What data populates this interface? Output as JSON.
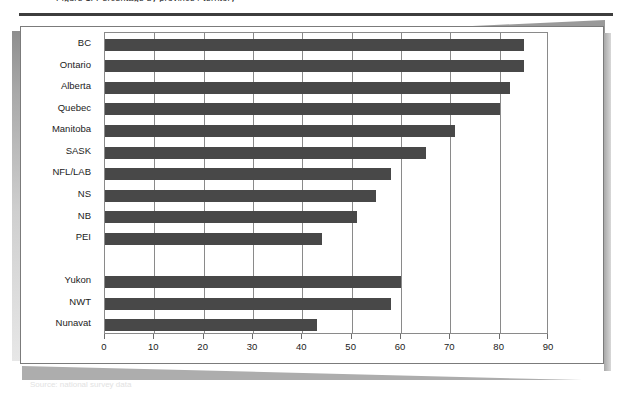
{
  "figure": {
    "caption_clipped": "Figure 1.  Percentage by province / territory",
    "footer_ghost": "Source: national survey data"
  },
  "chart_data": {
    "type": "bar",
    "orientation": "horizontal",
    "title": "",
    "xlabel": "",
    "ylabel": "",
    "xlim": [
      0,
      90
    ],
    "xticks": [
      0,
      10,
      20,
      30,
      40,
      50,
      60,
      70,
      80,
      90
    ],
    "grid": true,
    "grid_axis": "x",
    "legend": null,
    "bar_color": "#484848",
    "axis_color": "#8a8a8a",
    "categories": [
      "BC",
      "Ontario",
      "Alberta",
      "Quebec",
      "Manitoba",
      "SASK",
      "NFL/LAB",
      "NS",
      "NB",
      "PEI",
      "",
      "Yukon",
      "NWT",
      "Nunavat"
    ],
    "values": [
      85,
      85,
      82,
      80,
      71,
      65,
      58,
      55,
      51,
      44,
      null,
      60,
      58,
      43
    ],
    "groups": [
      {
        "name": "provinces",
        "categories": [
          "BC",
          "Ontario",
          "Alberta",
          "Quebec",
          "Manitoba",
          "SASK",
          "NFL/LAB",
          "NS",
          "NB",
          "PEI"
        ],
        "values": [
          85,
          85,
          82,
          80,
          71,
          65,
          58,
          55,
          51,
          44
        ]
      },
      {
        "name": "territories",
        "categories": [
          "Yukon",
          "NWT",
          "Nunavat"
        ],
        "values": [
          60,
          58,
          43
        ]
      }
    ]
  }
}
